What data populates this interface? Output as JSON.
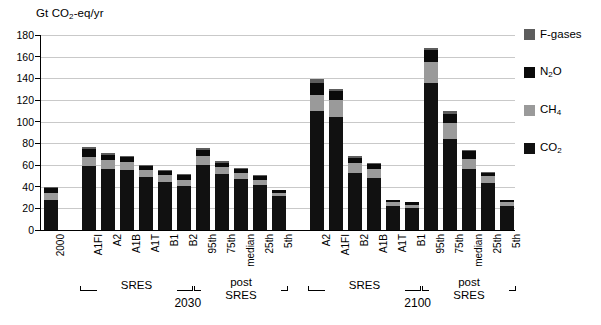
{
  "chart_data": {
    "type": "bar",
    "stacked": true,
    "title": "",
    "ylabel": "Gt CO2-eq/yr",
    "ylabel_rich": "Gt CO₂-eq/yr",
    "xlabel": "",
    "ylim": [
      0,
      180
    ],
    "ytick_step": 20,
    "yticks": [
      0,
      20,
      40,
      60,
      80,
      100,
      120,
      140,
      160,
      180
    ],
    "grid": "horizontal",
    "legend_position": "right",
    "series": [
      {
        "name": "CO2",
        "label": "CO₂",
        "color": "#111111",
        "values": [
          28.0,
          59.5,
          56.0,
          55.0,
          49.0,
          44.5,
          41.0,
          60.0,
          51.5,
          47.0,
          41.5,
          31.5,
          110.0,
          104.5,
          53.0,
          48.0,
          22.0,
          20.0,
          136.0,
          84.0,
          56.5,
          43.0,
          22.0
        ]
      },
      {
        "name": "CH4",
        "label": "CH₄",
        "color": "#9a9a9a",
        "values": [
          6.5,
          8.0,
          8.5,
          7.5,
          6.0,
          6.0,
          5.5,
          8.5,
          6.5,
          5.5,
          5.0,
          3.0,
          15.0,
          15.5,
          9.0,
          8.0,
          3.5,
          3.5,
          19.0,
          15.0,
          9.5,
          6.5,
          3.5
        ]
      },
      {
        "name": "N2O",
        "label": "N₂O",
        "color": "#0a0a0a",
        "values": [
          4.0,
          7.0,
          5.0,
          4.5,
          4.0,
          4.0,
          4.0,
          5.0,
          4.0,
          3.5,
          3.0,
          2.0,
          11.0,
          8.5,
          4.5,
          4.5,
          2.0,
          2.0,
          11.0,
          8.5,
          6.5,
          3.5,
          2.0
        ]
      },
      {
        "name": "F-gases",
        "label": "F-gases",
        "color": "#5d5d5d",
        "values": [
          1.5,
          2.0,
          1.5,
          1.5,
          1.0,
          1.0,
          1.0,
          2.0,
          1.5,
          1.0,
          1.0,
          0.5,
          3.0,
          2.0,
          1.5,
          1.5,
          0.5,
          0.5,
          2.0,
          2.0,
          1.5,
          1.0,
          0.5
        ]
      }
    ],
    "categories": [
      "2000",
      "A1FI",
      "A2",
      "A1B",
      "A1T",
      "B1",
      "B2",
      "95th",
      "75th",
      "median",
      "25th",
      "5th",
      "A2",
      "A1FI",
      "B2",
      "A1B",
      "A1T",
      "B1",
      "95th",
      "75th",
      "median",
      "25th",
      "5th"
    ],
    "totals": [
      40,
      76.5,
      71,
      68.5,
      60,
      55.5,
      51.5,
      75.5,
      63.5,
      57,
      50.5,
      37,
      139,
      130.5,
      68,
      62,
      28,
      26,
      168,
      109.5,
      74,
      54,
      28
    ],
    "bar_slots": [
      {
        "cat": "2000",
        "slot": 0,
        "group": null
      },
      {
        "cat": "A1FI",
        "slot": 2,
        "group": "sres-2030"
      },
      {
        "cat": "A2",
        "slot": 3,
        "group": "sres-2030"
      },
      {
        "cat": "A1B",
        "slot": 4,
        "group": "sres-2030"
      },
      {
        "cat": "A1T",
        "slot": 5,
        "group": "sres-2030"
      },
      {
        "cat": "B1",
        "slot": 6,
        "group": "sres-2030"
      },
      {
        "cat": "B2",
        "slot": 7,
        "group": "sres-2030"
      },
      {
        "cat": "95th",
        "slot": 8,
        "group": "post-sres-2030"
      },
      {
        "cat": "75th",
        "slot": 9,
        "group": "post-sres-2030"
      },
      {
        "cat": "median",
        "slot": 10,
        "group": "post-sres-2030"
      },
      {
        "cat": "25th",
        "slot": 11,
        "group": "post-sres-2030"
      },
      {
        "cat": "5th",
        "slot": 12,
        "group": "post-sres-2030"
      },
      {
        "cat": "A2",
        "slot": 14,
        "group": "sres-2100"
      },
      {
        "cat": "A1FI",
        "slot": 15,
        "group": "sres-2100"
      },
      {
        "cat": "B2",
        "slot": 16,
        "group": "sres-2100"
      },
      {
        "cat": "A1B",
        "slot": 17,
        "group": "sres-2100"
      },
      {
        "cat": "A1T",
        "slot": 18,
        "group": "sres-2100"
      },
      {
        "cat": "B1",
        "slot": 19,
        "group": "sres-2100"
      },
      {
        "cat": "95th",
        "slot": 20,
        "group": "post-sres-2100"
      },
      {
        "cat": "75th",
        "slot": 21,
        "group": "post-sres-2100"
      },
      {
        "cat": "median",
        "slot": 22,
        "group": "post-sres-2100"
      },
      {
        "cat": "25th",
        "slot": 23,
        "group": "post-sres-2100"
      },
      {
        "cat": "5th",
        "slot": 24,
        "group": "post-sres-2100"
      }
    ],
    "group_brackets": [
      {
        "id": "sres-2030",
        "label": "SRES",
        "from_slot": 2,
        "to_slot": 7
      },
      {
        "id": "post-sres-2030",
        "label": "post\nSRES",
        "from_slot": 8,
        "to_slot": 12
      },
      {
        "id": "sres-2100",
        "label": "SRES",
        "from_slot": 14,
        "to_slot": 19
      },
      {
        "id": "post-sres-2100",
        "label": "post\nSRES",
        "from_slot": 20,
        "to_slot": 24
      }
    ],
    "era_labels": [
      {
        "id": "era-2030",
        "label": "2030",
        "center_slot": 7.2
      },
      {
        "id": "era-2100",
        "label": "2100",
        "center_slot": 19.3
      }
    ]
  },
  "axis": {
    "y_title_prefix": "Gt CO",
    "y_title_sub": "2",
    "y_title_suffix": "-eq/yr",
    "ticks": [
      "180",
      "160",
      "140",
      "120",
      "100",
      "80",
      "60",
      "40",
      "20",
      "0"
    ]
  },
  "legend": {
    "items": [
      {
        "name": "fgas",
        "label": "F-gases",
        "sub": "",
        "suffix": "",
        "color": "#5d5d5d"
      },
      {
        "name": "n2o",
        "label": "N",
        "sub": "2",
        "suffix": "O",
        "color": "#0a0a0a"
      },
      {
        "name": "ch4",
        "label": "CH",
        "sub": "4",
        "suffix": "",
        "color": "#9a9a9a"
      },
      {
        "name": "co2",
        "label": "CO",
        "sub": "2",
        "suffix": "",
        "color": "#111111"
      }
    ]
  },
  "group_text": {
    "sres": "SRES",
    "post": "post",
    "post_second": "SRES",
    "year_2030": "2030",
    "year_2100": "2100"
  }
}
